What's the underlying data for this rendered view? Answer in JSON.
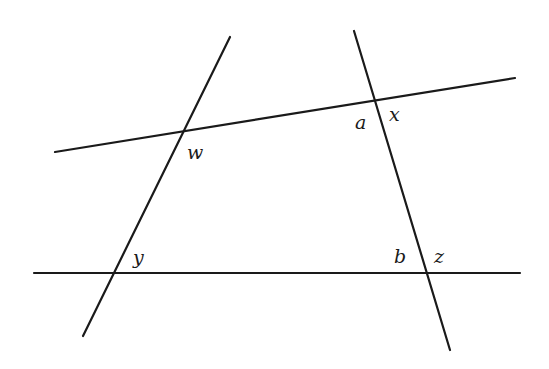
{
  "diagram": {
    "lines": [
      {
        "name": "upper-line",
        "x1": 55,
        "y1": 152,
        "x2": 515,
        "y2": 78
      },
      {
        "name": "lower-line",
        "x1": 34,
        "y1": 273,
        "x2": 520,
        "y2": 273
      },
      {
        "name": "left-transversal",
        "x1": 230,
        "y1": 37,
        "x2": 83,
        "y2": 336
      },
      {
        "name": "right-transversal",
        "x1": 354,
        "y1": 31,
        "x2": 450,
        "y2": 350
      }
    ],
    "labels": [
      {
        "name": "label-w",
        "text": "w",
        "x": 187,
        "y": 159
      },
      {
        "name": "label-a",
        "text": "a",
        "x": 355,
        "y": 129
      },
      {
        "name": "label-x",
        "text": "x",
        "x": 389,
        "y": 121
      },
      {
        "name": "label-y",
        "text": "y",
        "x": 133,
        "y": 264
      },
      {
        "name": "label-b",
        "text": "b",
        "x": 394,
        "y": 263
      },
      {
        "name": "label-z",
        "text": "z",
        "x": 434,
        "y": 263
      }
    ]
  }
}
